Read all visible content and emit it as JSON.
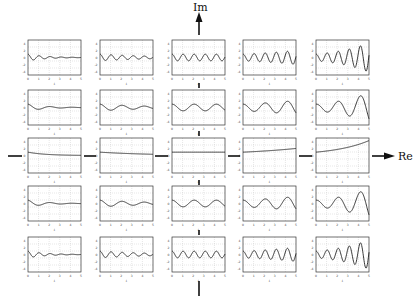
{
  "axes": {
    "real_label": "Re",
    "imag_label": "Im",
    "color": "#111111"
  },
  "plot_style": {
    "frame_color": "#333333",
    "grid_color": "#bfbfbf",
    "curve_color": "#222222",
    "tick_color": "#444444"
  },
  "plot_axes": {
    "xlabel": "t",
    "x_ticks": [
      "0",
      "1",
      "2",
      "3",
      "4",
      "5"
    ],
    "y_ticks": [
      "4",
      "2",
      "0",
      "-2",
      "-4"
    ],
    "xlim": [
      0,
      5
    ],
    "ylim": [
      -5,
      5
    ]
  },
  "grid": {
    "columns_x": [
      28,
      100,
      172,
      243,
      316
    ],
    "rows_y": [
      40,
      90,
      138,
      186,
      237
    ],
    "box_w": 53,
    "box_h": 35,
    "sigma_by_column": [
      -0.6,
      -0.2,
      0,
      0.15,
      0.3
    ],
    "omega_by_row": [
      6,
      3,
      0,
      3,
      6
    ]
  },
  "chart_data": {
    "type": "line",
    "xlabel": "t",
    "ylabel": "",
    "xlim": [
      0,
      5
    ],
    "ylim": [
      -5,
      5
    ],
    "layout": "5x5 grid of subplots; columns = real part (Re), rows = imaginary part (Im)",
    "series": [
      {
        "name": "row1-col1",
        "sigma": -0.6,
        "omega": 6
      },
      {
        "name": "row1-col2",
        "sigma": -0.2,
        "omega": 6
      },
      {
        "name": "row1-col3",
        "sigma": 0,
        "omega": 6
      },
      {
        "name": "row1-col4",
        "sigma": 0.15,
        "omega": 6
      },
      {
        "name": "row1-col5",
        "sigma": 0.3,
        "omega": 6
      },
      {
        "name": "row2-col1",
        "sigma": -0.6,
        "omega": 3
      },
      {
        "name": "row2-col2",
        "sigma": -0.2,
        "omega": 3
      },
      {
        "name": "row2-col3",
        "sigma": 0,
        "omega": 3
      },
      {
        "name": "row2-col4",
        "sigma": 0.15,
        "omega": 3
      },
      {
        "name": "row2-col5",
        "sigma": 0.3,
        "omega": 3
      },
      {
        "name": "row3-col1",
        "sigma": -0.6,
        "omega": 0
      },
      {
        "name": "row3-col2",
        "sigma": -0.2,
        "omega": 0
      },
      {
        "name": "row3-col3",
        "sigma": 0,
        "omega": 0
      },
      {
        "name": "row3-col4",
        "sigma": 0.15,
        "omega": 0
      },
      {
        "name": "row3-col5",
        "sigma": 0.3,
        "omega": 0
      },
      {
        "name": "row4-col1",
        "sigma": -0.6,
        "omega": 3
      },
      {
        "name": "row4-col2",
        "sigma": -0.2,
        "omega": 3
      },
      {
        "name": "row4-col3",
        "sigma": 0,
        "omega": 3
      },
      {
        "name": "row4-col4",
        "sigma": 0.15,
        "omega": 3
      },
      {
        "name": "row4-col5",
        "sigma": 0.3,
        "omega": 3
      },
      {
        "name": "row5-col1",
        "sigma": -0.6,
        "omega": 6
      },
      {
        "name": "row5-col2",
        "sigma": -0.2,
        "omega": 6
      },
      {
        "name": "row5-col3",
        "sigma": 0,
        "omega": 6
      },
      {
        "name": "row5-col4",
        "sigma": 0.15,
        "omega": 6
      },
      {
        "name": "row5-col5",
        "sigma": 0.3,
        "omega": 6
      }
    ]
  }
}
